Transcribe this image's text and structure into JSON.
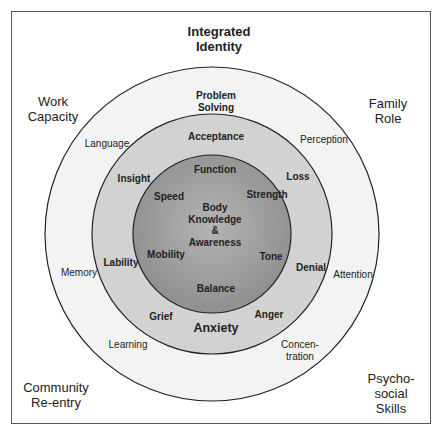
{
  "diagram": {
    "title": "Integrated\nIdentity",
    "corners": {
      "top_left": "Work\nCapacity",
      "top_right": "Family\nRole",
      "bottom_left": "Community\nRe-entry",
      "bottom_right": "Psycho-\nsocial\nSkills"
    },
    "outer_ring": {
      "top": "Problem\nSolving",
      "language": "Language",
      "perception": "Perception",
      "memory": "Memory",
      "attention": "Attention",
      "learning": "Learning",
      "concentration": "Concen-\ntration"
    },
    "middle_ring": {
      "acceptance": "Acceptance",
      "insight": "Insight",
      "loss": "Loss",
      "lability": "Lability",
      "denial": "Denial",
      "grief": "Grief",
      "anger": "Anger",
      "anxiety": "Anxiety"
    },
    "inner_circle": {
      "function": "Function",
      "speed": "Speed",
      "strength": "Strength",
      "center": "Body\nKnowledge\n&\nAwareness",
      "mobility": "Mobility",
      "tone": "Tone",
      "balance": "Balance"
    },
    "colors": {
      "outer_fill": "#f2f2f2",
      "middle_fill": "#d0d0d0",
      "inner_fill_light": "#b0b0b0",
      "inner_fill_dark": "#8a8a8a",
      "stroke": "#222222"
    }
  }
}
